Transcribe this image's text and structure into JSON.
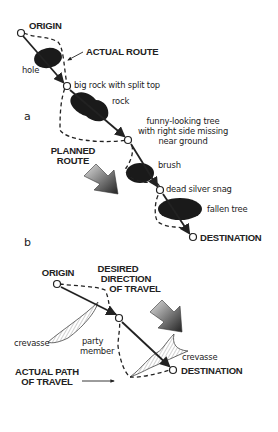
{
  "diagram": {
    "part_a": {
      "part_label": "a",
      "labels": {
        "origin": "ORIGIN",
        "actual_route": "ACTUAL ROUTE",
        "hole": "hole",
        "big_rock": "big rock with split top",
        "rock": "rock",
        "funny_tree_line1": "funny-looking tree",
        "funny_tree_line2": "with right side missing",
        "funny_tree_line3": "near ground",
        "brush": "brush",
        "dead_snag": "dead silver snag",
        "fallen_tree": "fallen tree",
        "planned_route_line1": "PLANNED",
        "planned_route_line2": "ROUTE",
        "destination": "DESTINATION"
      }
    },
    "part_b": {
      "part_label": "b",
      "labels": {
        "origin": "ORIGIN",
        "desired_line1": "DESIRED",
        "desired_line2": "DIRECTION",
        "desired_line3": "OF TRAVEL",
        "crevasse_left": "crevasse",
        "crevasse_right": "crevasse",
        "party_line1": "party",
        "party_line2": "member",
        "actual_path_line1": "ACTUAL PATH",
        "actual_path_line2": "OF TRAVEL",
        "destination": "DESTINATION"
      }
    },
    "colors": {
      "ink": "#222222",
      "obstacle": "#1a1a1a",
      "arrow_dark": "#2a2a2a",
      "arrow_light": "#c8c8c8"
    }
  }
}
